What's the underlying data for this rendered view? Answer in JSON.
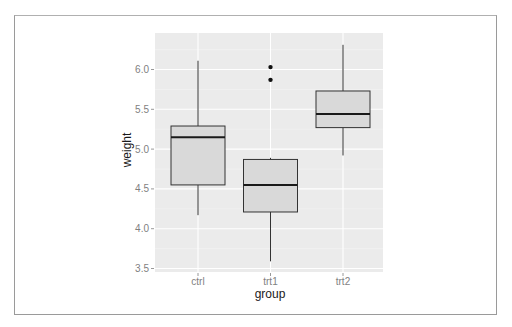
{
  "chart_data": {
    "type": "boxplot",
    "title": "",
    "xlabel": "group",
    "ylabel": "weight",
    "categories": [
      "ctrl",
      "trt1",
      "trt2"
    ],
    "ylim": [
      3.45,
      6.45
    ],
    "y_ticks": [
      "3.5",
      "4.0",
      "4.5",
      "5.0",
      "5.5",
      "6.0"
    ],
    "grid": true,
    "legend": null,
    "boxes": [
      {
        "group": "ctrl",
        "whisker_low": 4.17,
        "q1": 4.55,
        "median": 5.15,
        "q3": 5.29,
        "whisker_high": 6.11,
        "outliers": []
      },
      {
        "group": "trt1",
        "whisker_low": 3.59,
        "q1": 4.21,
        "median": 4.55,
        "q3": 4.87,
        "whisker_high": 4.89,
        "outliers": [
          6.03,
          5.87
        ]
      },
      {
        "group": "trt2",
        "whisker_low": 4.92,
        "q1": 5.27,
        "median": 5.44,
        "q3": 5.73,
        "whisker_high": 6.31,
        "outliers": []
      }
    ],
    "colors": {
      "panel_background": "#ebebeb",
      "grid_major": "#ffffff",
      "grid_minor": "#f4f4f4",
      "box_fill": "#d9d9d9",
      "box_outline": "#333333",
      "median_line": "#1a1a1a",
      "tick_label": "#7f7f7f"
    }
  }
}
